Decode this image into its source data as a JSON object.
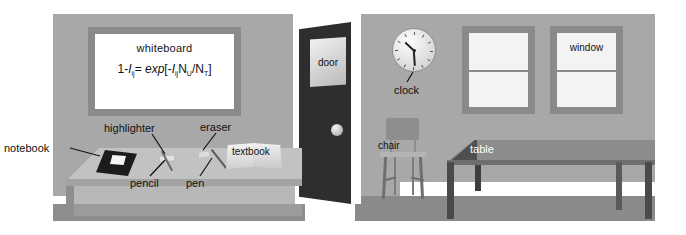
{
  "scene": {
    "type": "classroom-illustration",
    "title": "Labeled classroom scene",
    "background_color": "#ffffff",
    "wall_color": "#a8a8a8",
    "floor_color": "#8d8d8d"
  },
  "whiteboard": {
    "label": "whiteboard",
    "equation_plain": "1-Iij = exp[-Iij NU/NT]",
    "equation_parts": {
      "lhs_one": "1-",
      "lhs_sym": "I",
      "lhs_sub": "ij",
      "equals": "= ",
      "exp": "exp",
      "bracket_open": "[",
      "minus": "-",
      "rhs_sym": "I",
      "rhs_sub": "ij",
      "n_upper": "N",
      "n_upper_sub": "U",
      "slash": "/",
      "n_total": "N",
      "n_total_sub": "T",
      "bracket_close": "]"
    },
    "frame_color": "#8a8a8a",
    "face_color": "#ffffff"
  },
  "door": {
    "label": "door",
    "body_color": "#2e2e2e",
    "knob": "door-knob"
  },
  "clock": {
    "label": "clock",
    "hour_hand_deg": 222,
    "minute_hand_deg": 86,
    "face_color": "#fdfdfd"
  },
  "windows": [
    {
      "label": "",
      "name": "window-left"
    },
    {
      "label": "window",
      "name": "window-right"
    }
  ],
  "furniture": {
    "chair_label": "chair",
    "table_label": "table",
    "table_color": "#8c8c8c",
    "chair_color": "#8e8e8e"
  },
  "desk_items": [
    {
      "label": "notebook",
      "name": "notebook"
    },
    {
      "label": "highlighter",
      "name": "highlighter"
    },
    {
      "label": "eraser",
      "name": "eraser"
    },
    {
      "label": "pencil",
      "name": "pencil"
    },
    {
      "label": "pen",
      "name": "pen"
    },
    {
      "label": "textbook",
      "name": "textbook"
    }
  ]
}
